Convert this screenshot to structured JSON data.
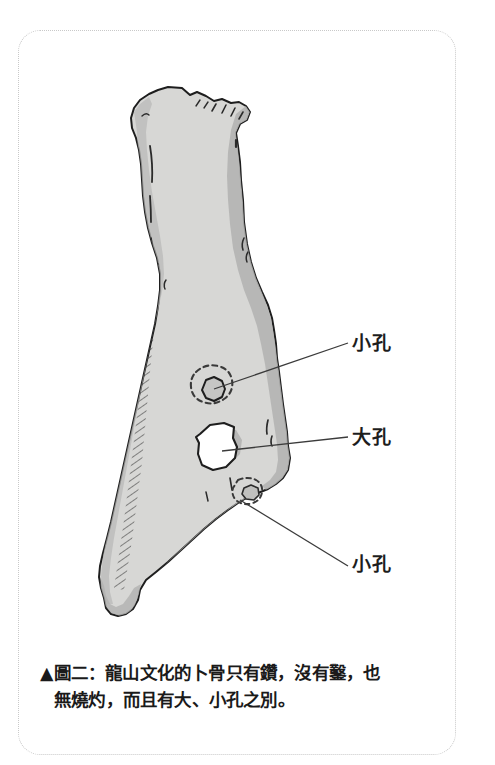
{
  "figure": {
    "caption_marker": "▲",
    "caption_line1": "▲圖二：龍山文化的卜骨只有鑽，沒有鑿，也",
    "caption_line2": "無燒灼，而且有大、小孔之別。",
    "caption_full": "▲圖二：龍山文化的卜骨只有鑽，沒有鑿，也無燒灼，而且有大、小孔之別。",
    "figure_number": "圖二"
  },
  "labels": {
    "small_hole_top": "小孔",
    "large_hole": "大孔",
    "small_hole_bottom": "小孔"
  },
  "colors": {
    "page_background": "#ffffff",
    "frame_border": "#c9c9c9",
    "bone_fill": "#d7d7d5",
    "bone_shadow": "#b2b2b0",
    "bone_outline": "#1e1e1e",
    "hole_fill": "#ffffff",
    "leader_line": "#3b3b3b",
    "text": "#1a1a1a"
  },
  "illustration": {
    "subject": "oracle bone (卜骨) of the Longshan culture",
    "features": [
      "small drilled hole (小孔) upper",
      "large drilled hole (大孔) middle",
      "small drilled hole (小孔) lower right edge"
    ]
  }
}
